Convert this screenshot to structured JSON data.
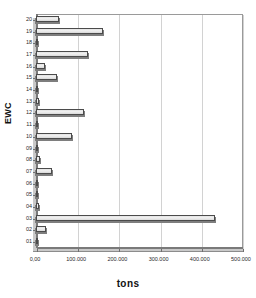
{
  "chart_data": {
    "type": "bar",
    "orientation": "horizontal",
    "title": "",
    "xlabel": "tons",
    "ylabel": "EWC",
    "categories": [
      "01",
      "02",
      "03",
      "04",
      "05",
      "06",
      "07",
      "08",
      "09",
      "10",
      "11",
      "12",
      "13",
      "14",
      "15",
      "16",
      "17",
      "18",
      "19",
      "20"
    ],
    "values": [
      2000,
      24000,
      434000,
      8000,
      3000,
      2500,
      38000,
      9000,
      3500,
      88000,
      6000,
      117000,
      7000,
      3000,
      51000,
      22000,
      127000,
      5000,
      163000,
      56000
    ],
    "xlim": [
      0,
      500000
    ],
    "xticks": [
      0,
      100000,
      200000,
      300000,
      400000,
      500000
    ],
    "xtick_labels": [
      "0,00",
      "100.000",
      "200.000",
      "300.000",
      "400.000",
      "500.000"
    ],
    "grid": true,
    "legend": false,
    "bar_fill_color": "#eeeeee",
    "bar_edge_color": "#4b4b4b",
    "grid_color": "#d2d2d2",
    "axis_color": "#7a7a7a",
    "panel_color": "#c9c9c9"
  }
}
